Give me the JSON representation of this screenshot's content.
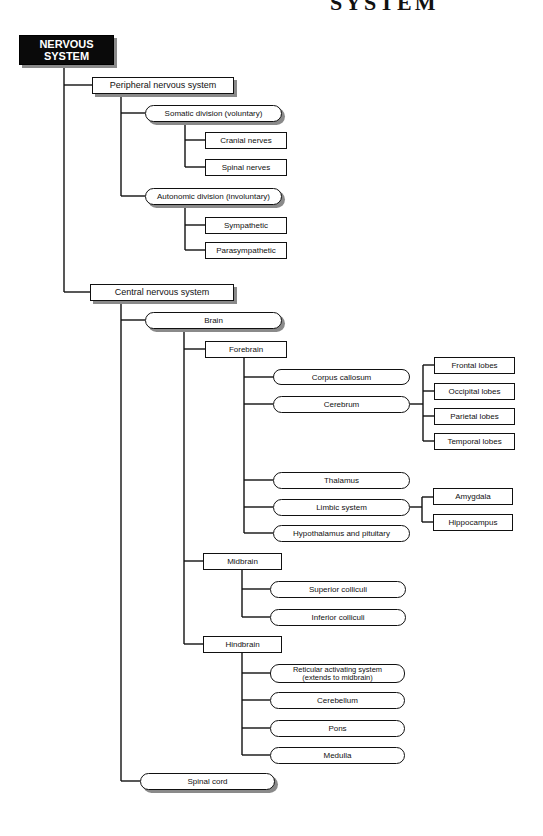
{
  "title_fragment": "SYSTEM",
  "root": {
    "label": "NERVOUS SYSTEM",
    "line1": "NERVOUS",
    "line2": "SYSTEM"
  },
  "peripheral": {
    "label": "Peripheral nervous system",
    "somatic": {
      "label": "Somatic division (voluntary)",
      "children": [
        "Cranial nerves",
        "Spinal nerves"
      ]
    },
    "autonomic": {
      "label": "Autonomic division (involuntary)",
      "children": [
        "Sympathetic",
        "Parasympathetic"
      ]
    }
  },
  "central": {
    "label": "Central nervous system",
    "brain": {
      "label": "Brain",
      "forebrain": {
        "label": "Forebrain",
        "corpus_callosum": "Corpus callosum",
        "cerebrum": {
          "label": "Cerebrum",
          "children": [
            "Frontal lobes",
            "Occipital lobes",
            "Parietal lobes",
            "Temporal lobes"
          ]
        },
        "thalamus": "Thalamus",
        "limbic": {
          "label": "Limbic system",
          "children": [
            "Amygdala",
            "Hippocampus"
          ]
        },
        "hypothalamus": "Hypothalamus and pituitary"
      },
      "midbrain": {
        "label": "Midbrain",
        "children": [
          "Superior colliculi",
          "Inferior colliculi"
        ]
      },
      "hindbrain": {
        "label": "Hindbrain",
        "reticular_line1": "Reticular activating system",
        "reticular_line2": "(extends to midbrain)",
        "children": [
          "Cerebellum",
          "Pons",
          "Medulla"
        ]
      }
    },
    "spinal_cord": "Spinal cord"
  },
  "colors": {
    "line": "#111111",
    "root_fill": "#0a0a0a",
    "shadow": "#8a8a8a",
    "background": "#ffffff"
  }
}
